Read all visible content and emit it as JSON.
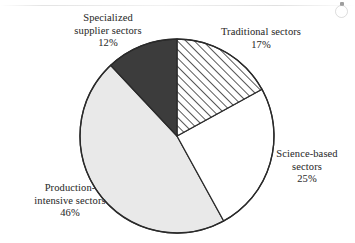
{
  "figure": {
    "kind": "pie-chart",
    "background_color": "#ffffff"
  },
  "chart_data": {
    "type": "pie",
    "title": "",
    "subtitle": "",
    "xlabel": "",
    "ylabel": "",
    "grid": false,
    "legend_position": "outside-labels",
    "units": "percent",
    "start_angle_deg": 0,
    "direction": "clockwise",
    "categories": [
      "Traditional sectors",
      "Science-based sectors",
      "Production-intensive sectors",
      "Specialized supplier sectors"
    ],
    "values": [
      17,
      25,
      46,
      12
    ],
    "value_labels": [
      "17%",
      "25%",
      "46%",
      "12%"
    ],
    "slices": [
      {
        "name": "Traditional sectors",
        "value": 17,
        "value_label": "17%",
        "fill_style": "diagonal-hatch",
        "fill_color": "#ffffff",
        "hatch_color": "#3b3b3b",
        "start_deg": 0,
        "end_deg": 61.2
      },
      {
        "name": "Science-based sectors",
        "value": 25,
        "value_label": "25%",
        "fill_style": "solid",
        "fill_color": "#ffffff",
        "start_deg": 61.2,
        "end_deg": 151.2
      },
      {
        "name": "Production-intensive sectors",
        "value": 46,
        "value_label": "46%",
        "fill_style": "solid",
        "fill_color": "#e9e9e9",
        "start_deg": 151.2,
        "end_deg": 316.8
      },
      {
        "name": "Specialized supplier sectors",
        "value": 12,
        "value_label": "12%",
        "fill_style": "solid",
        "fill_color": "#3c3c3c",
        "start_deg": 316.8,
        "end_deg": 360
      }
    ],
    "outline_color": "#2a2a2a"
  },
  "labels": {
    "specialized": {
      "line1": "Specialized",
      "line2": "supplier sectors",
      "line3": "12%"
    },
    "traditional": {
      "line1": "Traditional sectors",
      "line2": "17%"
    },
    "science": {
      "line1": "Science-based",
      "line2": "sectors",
      "line3": "25%"
    },
    "production": {
      "line1": "Production-",
      "line2": "intensive sectors",
      "line3": "46%"
    }
  }
}
